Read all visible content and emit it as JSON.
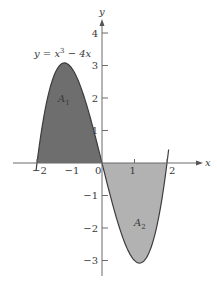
{
  "chart_data": {
    "type": "area",
    "title": "",
    "function": "y = x^3 - 4x",
    "curve_label": {
      "prefix": "y = x",
      "exponent": "3",
      "suffix": " − 4x"
    },
    "xlabel": "x",
    "ylabel": "y",
    "xlim": [
      -2.8,
      3.0
    ],
    "ylim": [
      -3.5,
      4.5
    ],
    "x_ticks": [
      -2,
      -1,
      0,
      1,
      2
    ],
    "x_tick_labels": [
      "−2",
      "−1",
      "0",
      "1",
      "2"
    ],
    "y_ticks": [
      -3,
      -2,
      -1,
      1,
      2,
      3,
      4
    ],
    "y_tick_labels": [
      "−3",
      "−2",
      "−1",
      "1",
      "2",
      "3",
      "4"
    ],
    "grid": false,
    "regions": [
      {
        "name": "A1",
        "label_base": "A",
        "label_sub": "1",
        "x_range": [
          -2,
          0
        ],
        "fill": "#6e6e6e",
        "sign": "positive"
      },
      {
        "name": "A2",
        "label_base": "A",
        "label_sub": "2",
        "x_range": [
          0,
          2
        ],
        "fill": "#b2b2b2",
        "sign": "negative"
      }
    ],
    "series": [
      {
        "name": "y = x^3 - 4x",
        "x": [
          -2,
          -1.75,
          -1.5,
          -1.25,
          -1.155,
          -1,
          -0.75,
          -0.5,
          -0.25,
          0,
          0.25,
          0.5,
          0.75,
          1,
          1.155,
          1.25,
          1.5,
          1.75,
          2
        ],
        "values": [
          0,
          1.64,
          2.63,
          3.05,
          3.08,
          3,
          2.58,
          1.88,
          0.98,
          0,
          -0.98,
          -1.88,
          -2.58,
          -3,
          -3.08,
          -3.05,
          -2.63,
          -1.64,
          0
        ]
      }
    ],
    "colors": {
      "axis": "#6a6a6a",
      "curve": "#3c3c3c",
      "text": "#3a3a3a"
    }
  }
}
